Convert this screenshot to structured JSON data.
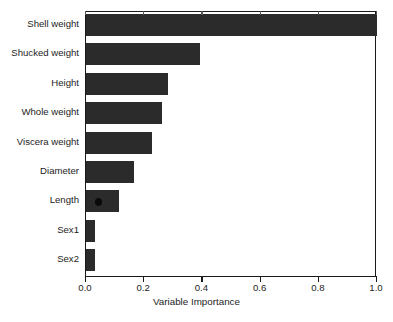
{
  "chart_data": {
    "type": "bar",
    "orientation": "horizontal",
    "title": "",
    "xlabel": "Variable Importance",
    "ylabel": "",
    "categories": [
      "Shell weight",
      "Shucked weight",
      "Height",
      "Whole weight",
      "Viscera weight",
      "Diameter",
      "Length",
      "Sex1",
      "Sex2"
    ],
    "values": [
      1.0,
      0.392,
      0.282,
      0.261,
      0.227,
      0.165,
      0.113,
      0.031,
      0.031
    ],
    "xlim": [
      0.0,
      1.0
    ],
    "xticks": [
      0.0,
      0.2,
      0.4,
      0.6,
      0.8,
      1.0
    ],
    "xticklabels": [
      "0.0",
      "0.2",
      "0.4",
      "0.6",
      "0.8",
      "1.0"
    ],
    "grid": false,
    "legend": null,
    "bar_color": "#2b2b2b",
    "axis_color": "#1a1a1a",
    "background": "#ffffff"
  },
  "axis": {
    "x_title": "Variable Importance"
  }
}
